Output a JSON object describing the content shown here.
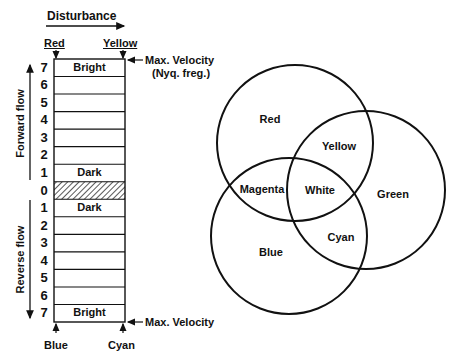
{
  "header": {
    "disturbance_label": "Disturbance",
    "top_left_color": "Red",
    "top_right_color": "Yellow",
    "bottom_left_color": "Blue",
    "bottom_right_color": "Cyan"
  },
  "annotations": {
    "max_velocity_top_line1": "Max. Velocity",
    "max_velocity_top_line2": "(Nyq. freg.)",
    "max_velocity_bottom": "Max. Velocity"
  },
  "axis": {
    "forward_label": "Forward flow",
    "reverse_label": "Reverse flow"
  },
  "scale": {
    "rows": [
      {
        "num": "7",
        "text": "Bright",
        "hatched": false
      },
      {
        "num": "6",
        "text": "",
        "hatched": false
      },
      {
        "num": "5",
        "text": "",
        "hatched": false
      },
      {
        "num": "4",
        "text": "",
        "hatched": false
      },
      {
        "num": "3",
        "text": "",
        "hatched": false
      },
      {
        "num": "2",
        "text": "",
        "hatched": false
      },
      {
        "num": "1",
        "text": "Dark",
        "hatched": false
      },
      {
        "num": "0",
        "text": "",
        "hatched": true
      },
      {
        "num": "1",
        "text": "Dark",
        "hatched": false
      },
      {
        "num": "2",
        "text": "",
        "hatched": false
      },
      {
        "num": "3",
        "text": "",
        "hatched": false
      },
      {
        "num": "4",
        "text": "",
        "hatched": false
      },
      {
        "num": "5",
        "text": "",
        "hatched": false
      },
      {
        "num": "6",
        "text": "",
        "hatched": false
      },
      {
        "num": "7",
        "text": "Bright",
        "hatched": false
      }
    ]
  },
  "venn": {
    "circles": [
      {
        "name": "Red",
        "cx": 295,
        "cy": 143,
        "r": 78
      },
      {
        "name": "Green",
        "cx": 366,
        "cy": 190,
        "r": 79
      },
      {
        "name": "Blue",
        "cx": 289,
        "cy": 236,
        "r": 78
      }
    ],
    "regions": [
      {
        "label": "Red",
        "x": 270,
        "y": 119
      },
      {
        "label": "Yellow",
        "x": 339,
        "y": 146
      },
      {
        "label": "Magenta",
        "x": 262,
        "y": 189
      },
      {
        "label": "White",
        "x": 320,
        "y": 190
      },
      {
        "label": "Green",
        "x": 393,
        "y": 194
      },
      {
        "label": "Cyan",
        "x": 341,
        "y": 237
      },
      {
        "label": "Blue",
        "x": 271,
        "y": 252
      }
    ]
  },
  "colors": {
    "ink": "#111111",
    "background": "#ffffff"
  }
}
